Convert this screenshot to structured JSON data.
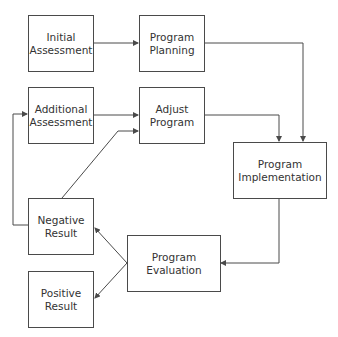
{
  "diagram": {
    "type": "flowchart",
    "nodes": [
      {
        "id": "initial_assessment",
        "line1": "Initial",
        "line2": "Assessment"
      },
      {
        "id": "program_planning",
        "line1": "Program",
        "line2": "Planning"
      },
      {
        "id": "additional_assessment",
        "line1": "Additional",
        "line2": "Assessment"
      },
      {
        "id": "adjust_program",
        "line1": "Adjust",
        "line2": "Program"
      },
      {
        "id": "program_implementation",
        "line1": "Program",
        "line2": "Implementation"
      },
      {
        "id": "program_evaluation",
        "line1": "Program",
        "line2": "Evaluation"
      },
      {
        "id": "negative_result",
        "line1": "Negative",
        "line2": "Result"
      },
      {
        "id": "positive_result",
        "line1": "Positive",
        "line2": "Result"
      }
    ],
    "edges": [
      {
        "from": "initial_assessment",
        "to": "program_planning"
      },
      {
        "from": "program_planning",
        "to": "program_implementation"
      },
      {
        "from": "additional_assessment",
        "to": "adjust_program"
      },
      {
        "from": "adjust_program",
        "to": "program_implementation"
      },
      {
        "from": "program_implementation",
        "to": "program_evaluation"
      },
      {
        "from": "program_evaluation",
        "to": "negative_result"
      },
      {
        "from": "program_evaluation",
        "to": "positive_result"
      },
      {
        "from": "negative_result",
        "to": "additional_assessment"
      },
      {
        "from": "negative_result",
        "to": "adjust_program"
      }
    ],
    "colors": {
      "stroke": "#4a4a4a",
      "text": "#333333",
      "background": "#ffffff"
    }
  }
}
